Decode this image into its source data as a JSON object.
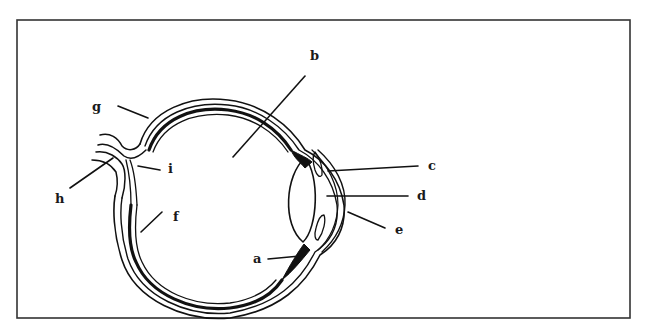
{
  "diagram": {
    "type": "anatomical-diagram",
    "frame": {
      "x": 17,
      "y": 20,
      "width": 613,
      "height": 298,
      "stroke": "#333333"
    },
    "colors": {
      "ink": "#111111",
      "background": "#ffffff"
    },
    "labels": {
      "a": {
        "text": "a",
        "x": 253,
        "y": 263,
        "line": [
          268,
          259,
          300,
          256
        ]
      },
      "b": {
        "text": "b",
        "x": 310,
        "y": 60,
        "line": [
          305,
          76,
          233,
          157
        ]
      },
      "c": {
        "text": "c",
        "x": 428,
        "y": 170,
        "line": [
          328,
          171,
          418,
          166
        ]
      },
      "d": {
        "text": "d",
        "x": 417,
        "y": 200,
        "line": [
          327,
          196,
          408,
          196
        ]
      },
      "e": {
        "text": "e",
        "x": 395,
        "y": 234,
        "line": [
          348,
          212,
          385,
          228
        ]
      },
      "f": {
        "text": "f",
        "x": 173,
        "y": 221,
        "line": [
          162,
          212,
          141,
          232
        ]
      },
      "g": {
        "text": "g",
        "x": 92,
        "y": 111,
        "line": [
          118,
          106,
          148,
          118
        ]
      },
      "h": {
        "text": "h",
        "x": 55,
        "y": 203,
        "line": [
          70,
          188,
          113,
          158
        ]
      },
      "i": {
        "text": "i",
        "x": 168,
        "y": 173,
        "line": [
          138,
          166,
          160,
          170
        ]
      }
    }
  }
}
